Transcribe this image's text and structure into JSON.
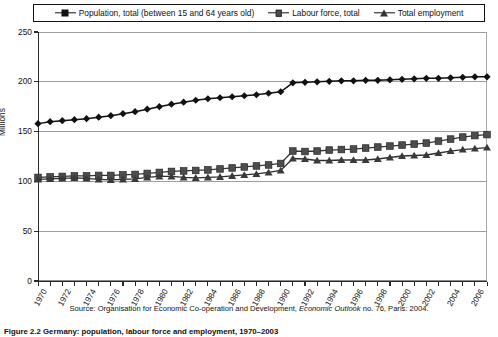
{
  "legend": {
    "entries": [
      {
        "label": "Population, total (between 15 and 64 years old)",
        "marker": "diamond-marker",
        "color": "#111111"
      },
      {
        "label": "Labour force, total",
        "marker": "square-marker",
        "color": "#4d4d4d"
      },
      {
        "label": "Total employment",
        "marker": "triangle-marker",
        "color": "#333333"
      }
    ]
  },
  "axes": {
    "ylabel": "Millions",
    "yticks": [
      "0",
      "50",
      "100",
      "150",
      "200",
      "250"
    ],
    "xticks": [
      "1970",
      "1972",
      "1974",
      "1976",
      "1978",
      "1980",
      "1982",
      "1984",
      "1986",
      "1988",
      "1990",
      "1992",
      "1994",
      "1996",
      "1998",
      "2000",
      "2002",
      "2004",
      "2006"
    ]
  },
  "source_note": {
    "prefix": "Source: Organisation for Economic Co-operation and Development, ",
    "italic": "Economic Outlook",
    "suffix": " no. 76, Paris: 2004."
  },
  "caption": {
    "title": "Figure 2.2",
    "rest": "Germany: population, labour force and employment, 1970–2003"
  },
  "chart_data": {
    "type": "line",
    "title": "",
    "xlabel": "",
    "ylabel": "Millions",
    "ylim": [
      0,
      250
    ],
    "xlim": [
      1970,
      2007
    ],
    "grid": true,
    "legend_position": "top",
    "x": [
      1970,
      1971,
      1972,
      1973,
      1974,
      1975,
      1976,
      1977,
      1978,
      1979,
      1980,
      1981,
      1982,
      1983,
      1984,
      1985,
      1986,
      1987,
      1988,
      1989,
      1990,
      1991,
      1992,
      1993,
      1994,
      1995,
      1996,
      1997,
      1998,
      1999,
      2000,
      2001,
      2002,
      2003,
      2004,
      2005,
      2006,
      2007
    ],
    "series": [
      {
        "name": "Population, total (between 15 and 64 years old)",
        "marker": "diamond",
        "values": [
          158.0,
          160.0,
          161.0,
          162.0,
          163.0,
          164.5,
          166.0,
          168.0,
          170.0,
          172.5,
          175.0,
          177.5,
          179.5,
          181.5,
          183.0,
          184.0,
          185.0,
          186.0,
          187.0,
          188.5,
          190.0,
          199.0,
          199.5,
          200.0,
          200.5,
          201.0,
          201.0,
          201.5,
          201.5,
          202.0,
          202.5,
          203.0,
          203.5,
          203.5,
          204.0,
          204.5,
          205.0,
          205.0
        ]
      },
      {
        "name": "Labour force, total",
        "marker": "square",
        "values": [
          104.0,
          104.5,
          105.0,
          105.5,
          105.5,
          106.0,
          106.0,
          106.5,
          107.0,
          108.0,
          109.0,
          110.0,
          110.5,
          111.0,
          111.5,
          112.5,
          113.5,
          114.5,
          115.5,
          116.5,
          118.0,
          130.5,
          130.0,
          130.5,
          131.5,
          132.0,
          132.5,
          133.5,
          134.5,
          135.5,
          136.5,
          137.5,
          138.5,
          140.5,
          142.5,
          144.5,
          146.0,
          147.0
        ]
      },
      {
        "name": "Total employment",
        "marker": "triangle",
        "values": [
          102.0,
          102.5,
          103.0,
          103.5,
          103.0,
          102.0,
          101.5,
          102.0,
          102.5,
          104.0,
          105.0,
          105.0,
          104.0,
          103.5,
          104.0,
          104.5,
          105.5,
          106.5,
          107.5,
          109.0,
          111.0,
          123.0,
          122.5,
          121.0,
          121.0,
          121.5,
          121.5,
          121.5,
          122.5,
          124.0,
          125.5,
          126.0,
          126.5,
          128.5,
          130.5,
          132.0,
          133.0,
          134.0
        ]
      }
    ]
  }
}
